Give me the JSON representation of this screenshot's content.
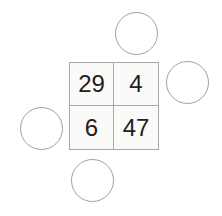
{
  "puzzle": {
    "grid": {
      "rows": 2,
      "cols": 2,
      "cells": [
        "29",
        "4",
        "6",
        "47"
      ]
    },
    "circles": [
      {
        "position": "top",
        "value": ""
      },
      {
        "position": "right",
        "value": ""
      },
      {
        "position": "left",
        "value": ""
      },
      {
        "position": "bottom",
        "value": ""
      }
    ]
  },
  "colors": {
    "line": "#a8a8a8",
    "text": "#222222",
    "cell_fill": "#fafaf8"
  }
}
